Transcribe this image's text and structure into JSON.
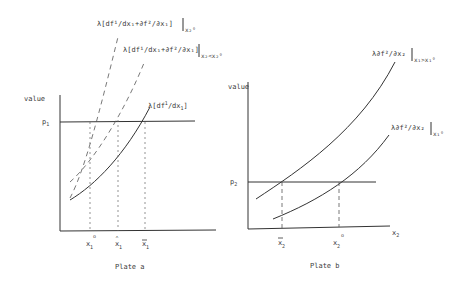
{
  "plate_a": {
    "caption": "Plate a",
    "y_label": "value",
    "price_label": "p",
    "price_sub": "1",
    "curves": {
      "marginal_1": {
        "prefix": "λ[df",
        "sup": "1",
        "mid": "/dx",
        "sub": "1",
        "suffix": "]"
      },
      "sum_x2_lt": {
        "text": "λ[df¹/dx₁+∂f²/∂x₁]",
        "condition": "x₂<x₂°"
      },
      "sum_x2_0": {
        "text": "λ[df¹/dx₁+∂f²/∂x₁]",
        "condition": "x₂°"
      }
    },
    "x_ticks": [
      {
        "base": "x",
        "sub": "1",
        "mark": "o",
        "mark_type": "superscript"
      },
      {
        "base": "x",
        "sub": "1",
        "mark": "^",
        "mark_type": "hat"
      },
      {
        "base": "x",
        "sub": "1",
        "mark": "—",
        "mark_type": "bar"
      }
    ]
  },
  "plate_b": {
    "caption": "Plate b",
    "y_label": "value",
    "x_label": "x",
    "x_label_sub": "2",
    "price_label": "p",
    "price_sub": "2",
    "curves": {
      "upper": {
        "text": "λ∂f²/∂x₂",
        "condition": "x₁>x₁°"
      },
      "lower": {
        "text": "λ∂f²/∂x₂",
        "condition": "x₁°"
      }
    },
    "x_ticks": [
      {
        "base": "x",
        "sub": "2",
        "mark": "—",
        "mark_type": "bar"
      },
      {
        "base": "x",
        "sub": "2",
        "mark": "o",
        "mark_type": "superscript"
      }
    ]
  },
  "colors": {
    "ink": "#333333",
    "background": "#ffffff"
  }
}
